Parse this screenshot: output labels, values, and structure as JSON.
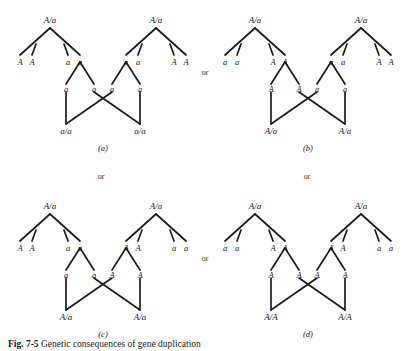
{
  "figure": {
    "caption_prefix": "Fig. 7-5",
    "caption_text": "Genetic consequences of gene duplication",
    "background_color": "#ffffff",
    "line_color": "#1a1a1a"
  },
  "connectors": {
    "or_top": "or",
    "or_left_middle": "or",
    "or_right_middle": "or",
    "or_bottom_center": "or"
  },
  "panels": [
    {
      "id": "a",
      "tag": "(a)",
      "left_parent": {
        "genotype": "A/a",
        "leaves": [
          "A",
          "A",
          "a",
          "a"
        ],
        "fork_side": "right"
      },
      "right_parent": {
        "genotype": "A/a",
        "leaves": [
          "a",
          "a",
          "A",
          "A"
        ],
        "fork_side": "left"
      },
      "gametes": [
        "a",
        "a",
        "a",
        "a"
      ],
      "offspring": [
        "a/a",
        "a/a"
      ]
    },
    {
      "id": "b",
      "tag": "(b)",
      "left_parent": {
        "genotype": "A/a",
        "leaves": [
          "a",
          "a",
          "A",
          "A"
        ],
        "fork_side": "right"
      },
      "right_parent": {
        "genotype": "A/a",
        "leaves": [
          "a",
          "a",
          "A",
          "A"
        ],
        "fork_side": "left"
      },
      "gametes": [
        "A",
        "A",
        "a",
        "a"
      ],
      "offspring": [
        "A/a",
        "A/a"
      ]
    },
    {
      "id": "c",
      "tag": "(c)",
      "left_parent": {
        "genotype": "A/a",
        "leaves": [
          "A",
          "A",
          "a",
          "a"
        ],
        "fork_side": "right"
      },
      "right_parent": {
        "genotype": "A/a",
        "leaves": [
          "A",
          "A",
          "a",
          "a"
        ],
        "fork_side": "left"
      },
      "gametes": [
        "a",
        "a",
        "A",
        "A"
      ],
      "offspring": [
        "A/a",
        "A/a"
      ]
    },
    {
      "id": "d",
      "tag": "(d)",
      "left_parent": {
        "genotype": "A/a",
        "leaves": [
          "a",
          "a",
          "A",
          "A"
        ],
        "fork_side": "right"
      },
      "right_parent": {
        "genotype": "A/a",
        "leaves": [
          "A",
          "A",
          "a",
          "a"
        ],
        "fork_side": "left"
      },
      "gametes": [
        "A",
        "A",
        "A",
        "A"
      ],
      "offspring": [
        "A/A",
        "A/A"
      ]
    }
  ]
}
